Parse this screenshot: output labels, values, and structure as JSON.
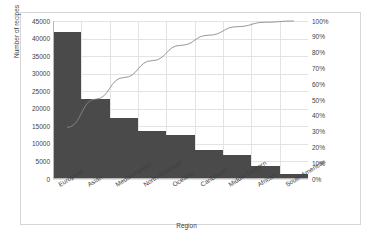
{
  "chart_data": {
    "type": "bar",
    "title": "",
    "subtitle": "",
    "xlabel": "Region",
    "ylabel": "Number of recipes",
    "y2label": "",
    "grid": true,
    "legend": "none",
    "categories": [
      "European",
      "Asian",
      "Mediterranean",
      "North American",
      "Oceanic",
      "Caribbean",
      "Middle Eastern",
      "African",
      "South American"
    ],
    "values": [
      41900,
      22800,
      17500,
      13700,
      12500,
      8200,
      6900,
      3600,
      1400
    ],
    "cumulative_percent": [
      32.7,
      50.5,
      64.2,
      74.9,
      84.6,
      91.0,
      96.4,
      99.2,
      100.0
    ],
    "ylim": [
      0,
      45000
    ],
    "y2lim": [
      0,
      100
    ],
    "yticks": [
      0,
      5000,
      10000,
      15000,
      20000,
      25000,
      30000,
      35000,
      40000,
      45000
    ],
    "ytick_labels": [
      "0",
      "5000",
      "10000",
      "15000",
      "20000",
      "25000",
      "30000",
      "35000",
      "40000",
      "45000"
    ],
    "y2ticks": [
      0,
      10,
      20,
      30,
      40,
      50,
      60,
      70,
      80,
      90,
      100
    ],
    "y2tick_labels": [
      "0%",
      "10%",
      "20%",
      "30%",
      "40%",
      "50%",
      "60%",
      "70%",
      "80%",
      "90%",
      "100%"
    ],
    "series": [
      {
        "name": "Number of recipes",
        "type": "bar",
        "color": "#4a4a4a",
        "axis": "left",
        "values": [
          41900,
          22800,
          17500,
          13700,
          12500,
          8200,
          6900,
          3600,
          1400
        ]
      },
      {
        "name": "Cumulative %",
        "type": "line",
        "color": "#8a8a8a",
        "axis": "right",
        "values": [
          32.7,
          50.5,
          64.2,
          74.9,
          84.6,
          91.0,
          96.4,
          99.2,
          100.0
        ]
      }
    ]
  },
  "colors": {
    "bar": "#4a4a4a",
    "line": "#8a8a8a",
    "grid": "#e3e3e3",
    "axis": "#b8b8b8",
    "text": "#3f3f3f",
    "frame": "#d6d6d6",
    "background": "#ffffff"
  }
}
